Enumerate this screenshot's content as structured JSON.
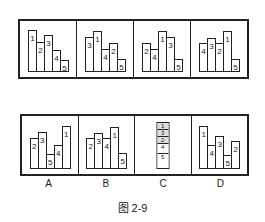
{
  "chart_data": {
    "type": "diagram",
    "title": "图 2-9",
    "top_row": [
      {
        "order": [
          "1",
          "2",
          "3",
          "4",
          "5"
        ],
        "heights": [
          42,
          30,
          37,
          22,
          12
        ]
      },
      {
        "order": [
          "3",
          "1",
          "4",
          "2",
          "5"
        ],
        "heights": [
          35,
          41,
          23,
          29,
          13
        ]
      },
      {
        "order": [
          "2",
          "4",
          "1",
          "3",
          "5"
        ],
        "heights": [
          29,
          23,
          41,
          35,
          13
        ]
      },
      {
        "order": [
          "4",
          "3",
          "2",
          "1",
          "5"
        ],
        "heights": [
          29,
          34,
          29,
          41,
          13
        ]
      }
    ],
    "options": [
      {
        "label": "A",
        "order": [
          "2",
          "3",
          "5",
          "4",
          "1"
        ],
        "heights": [
          31,
          37,
          15,
          24,
          43
        ]
      },
      {
        "label": "B",
        "order": [
          "2",
          "3",
          "4",
          "1",
          "5"
        ],
        "heights": [
          31,
          36,
          31,
          42,
          16
        ]
      },
      {
        "label": "C",
        "type": "stacked",
        "order": [
          "1",
          "3",
          "2",
          "4",
          "5"
        ]
      },
      {
        "label": "D",
        "order": [
          "1",
          "4",
          "3",
          "5",
          "2"
        ],
        "heights": [
          43,
          24,
          33,
          14,
          28
        ]
      }
    ]
  },
  "labels": [
    "A",
    "B",
    "C",
    "D"
  ],
  "caption": "图 2-9"
}
